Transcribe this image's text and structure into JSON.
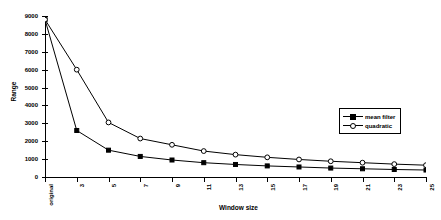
{
  "chart_data": {
    "type": "line",
    "title": "",
    "subtitle": "",
    "xlabel": "Window size",
    "ylabel": "Range",
    "categories": [
      "original",
      "3",
      "5",
      "7",
      "9",
      "11",
      "13",
      "15",
      "17",
      "19",
      "21",
      "23",
      "25"
    ],
    "x": [
      0,
      1,
      2,
      3,
      4,
      5,
      6,
      7,
      8,
      9,
      10,
      11,
      12
    ],
    "ylim": [
      0,
      9000
    ],
    "xlim": [
      0,
      12
    ],
    "yticks": [
      0,
      1000,
      2000,
      3000,
      4000,
      5000,
      6000,
      7000,
      8000,
      9000
    ],
    "ytick_labels": [
      "0",
      "1000",
      "2000",
      "3000",
      "4000",
      "5000",
      "6000",
      "7000",
      "8000",
      "9000"
    ],
    "grid": false,
    "legend_position": "inside-right",
    "series": [
      {
        "name": "mean filter",
        "marker": "filled-square",
        "color": "#000000",
        "values": [
          8800,
          2600,
          1500,
          1150,
          950,
          800,
          700,
          620,
          560,
          500,
          460,
          420,
          390
        ]
      },
      {
        "name": "quadratic",
        "marker": "open-circle",
        "color": "#000000",
        "values": [
          8800,
          6000,
          3050,
          2150,
          1800,
          1450,
          1250,
          1100,
          980,
          880,
          800,
          720,
          660
        ]
      }
    ]
  },
  "legend": {
    "items": [
      {
        "label": "mean filter",
        "marker": "filled-square"
      },
      {
        "label": "quadratic",
        "marker": "open-circle"
      }
    ]
  },
  "axes": {
    "x_title": "Window size",
    "y_title": "Range"
  }
}
